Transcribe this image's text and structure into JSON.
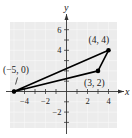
{
  "chart_data": {
    "type": "scatter",
    "title": "",
    "xlabel": "x",
    "ylabel": "y",
    "xlim": [
      -5.5,
      4.8
    ],
    "ylim": [
      -3.5,
      6.8
    ],
    "grid": true,
    "x_ticks": [
      -4,
      -2,
      2,
      4
    ],
    "y_ticks": [
      -2,
      4,
      6
    ],
    "x_minor_ticks": [
      -5,
      -4,
      -3,
      -2,
      -1,
      1,
      2,
      3,
      4
    ],
    "y_minor_ticks": [
      -3,
      -2,
      -1,
      1,
      2,
      3,
      4,
      5,
      6
    ],
    "points": [
      {
        "x": -5,
        "y": 0,
        "label": "(−5, 0)"
      },
      {
        "x": 4,
        "y": 4,
        "label": "(4, 4)"
      },
      {
        "x": 3,
        "y": 2,
        "label": "(3, 2)"
      }
    ],
    "polygon": {
      "type": "triangle",
      "vertices": [
        [
          -5,
          0
        ],
        [
          4,
          4
        ],
        [
          3,
          2
        ]
      ],
      "stroke": "#000000"
    },
    "colors": {
      "grid_background": "#ececec",
      "grid_line": "#f8f8f8",
      "axis": "#333333",
      "triangle": "#000000"
    }
  }
}
